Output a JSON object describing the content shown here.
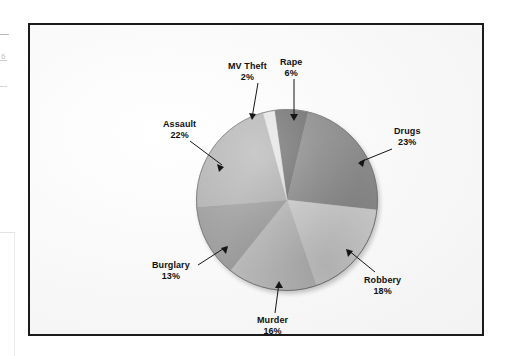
{
  "figure": {
    "frame_border_color": "#1b1b1b",
    "background_color": "#fbfbfb"
  },
  "chart_data": {
    "type": "pie",
    "title": "",
    "subtitle": "",
    "xlabel": "",
    "ylabel": "",
    "legend_position": "none",
    "grid": false,
    "units": "percent",
    "start_angle_deg": 352,
    "direction": "clockwise",
    "categories": [
      "Rape",
      "Drugs",
      "Robbery",
      "Murder",
      "Burglary",
      "Assault",
      "MV Theft"
    ],
    "values": [
      6,
      23,
      18,
      16,
      13,
      22,
      2
    ],
    "colors": [
      "#6f6f6f",
      "#8c8c8c",
      "#d2d2d2",
      "#bdbdbd",
      "#9d9d9d",
      "#b2b2b2",
      "#e4e4e4"
    ],
    "slices": [
      {
        "label": "Rape",
        "value": 6,
        "pct_text": "6%",
        "color": "#6f6f6f"
      },
      {
        "label": "Drugs",
        "value": 23,
        "pct_text": "23%",
        "color": "#8c8c8c"
      },
      {
        "label": "Robbery",
        "value": 18,
        "pct_text": "18%",
        "color": "#d2d2d2"
      },
      {
        "label": "Murder",
        "value": 16,
        "pct_text": "16%",
        "color": "#bdbdbd"
      },
      {
        "label": "Burglary",
        "value": 13,
        "pct_text": "13%",
        "color": "#9d9d9d"
      },
      {
        "label": "Assault",
        "value": 22,
        "pct_text": "22%",
        "color": "#b2b2b2"
      },
      {
        "label": "MV Theft",
        "value": 2,
        "pct_text": "2%",
        "color": "#e4e4e4"
      }
    ]
  },
  "labels": {
    "mv_theft": {
      "name": "MV Theft",
      "pct": "2%"
    },
    "rape": {
      "name": "Rape",
      "pct": "6%"
    },
    "drugs": {
      "name": "Drugs",
      "pct": "23%"
    },
    "robbery": {
      "name": "Robbery",
      "pct": "18%"
    },
    "murder": {
      "name": "Murder",
      "pct": "16%"
    },
    "burglary": {
      "name": "Burglary",
      "pct": "13%"
    },
    "assault": {
      "name": "Assault",
      "pct": "22%"
    }
  },
  "artifacts": {
    "margin_glyph": "6"
  }
}
